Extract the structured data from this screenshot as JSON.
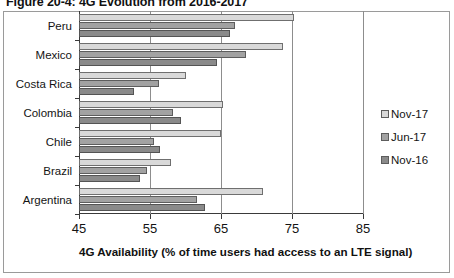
{
  "figure": {
    "title": "Figure 20-4: 4G Evolution from 2016-2017"
  },
  "chart_data": {
    "type": "bar",
    "orientation": "horizontal",
    "title": "Figure 20-4: 4G Evolution from 2016-2017",
    "xlabel": "4G Availability (% of time users had access to an LTE signal)",
    "ylabel": "",
    "xlim": [
      45,
      85
    ],
    "xticks": [
      45,
      55,
      65,
      75,
      85
    ],
    "grid": true,
    "legend_position": "right",
    "categories": [
      "Peru",
      "Mexico",
      "Costa Rica",
      "Colombia",
      "Chile",
      "Brazil",
      "Argentina"
    ],
    "series": [
      {
        "name": "Nov-17",
        "color": "#d9d9d9",
        "values": [
          75.3,
          73.7,
          60.0,
          65.3,
          65.0,
          57.9,
          70.9
        ]
      },
      {
        "name": "Jun-17",
        "color": "#a2a2a2",
        "values": [
          67.0,
          68.5,
          56.2,
          58.2,
          55.5,
          54.6,
          61.6
        ]
      },
      {
        "name": "Nov-16",
        "color": "#8a8a8a",
        "values": [
          66.3,
          64.5,
          52.8,
          59.3,
          56.4,
          53.6,
          62.8
        ]
      }
    ]
  }
}
